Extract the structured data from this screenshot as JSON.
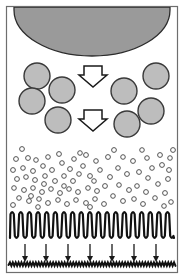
{
  "figure": {
    "width": 185,
    "height": 280,
    "background": "#ffffff",
    "frame": {
      "x": 6.5,
      "y": 6.5,
      "width": 171,
      "height": 266,
      "stroke": "#6e6e6e",
      "stroke_width": 1.2,
      "fill": "#ffffff"
    },
    "colors": {
      "particle_fill": "#bdbdbd",
      "particle_stroke": "#3a3a3a",
      "dome_fill": "#9a9a9a",
      "dome_stroke": "#2b2b2b",
      "bubble_fill": "#ffffff",
      "bubble_stroke": "#4a4a4a",
      "arrow_fill": "#ffffff",
      "arrow_stroke": "#1a1a1a",
      "wave_stroke": "#111111",
      "small_arrow_stroke": "#1a1a1a",
      "substrate_stroke": "#111111",
      "frame_stroke": "#6e6e6e"
    },
    "layers": [
      {
        "name": "source-dome",
        "label": "source-dome",
        "shape": "half-ellipse",
        "cx": 92,
        "top": 8,
        "rx": 78,
        "ry": 45
      },
      {
        "name": "particle-field",
        "label": "particle-field",
        "shape": "large-circles",
        "radius": 13,
        "count": 8,
        "positions": [
          {
            "cx": 37,
            "cy": 76
          },
          {
            "cx": 62,
            "cy": 90
          },
          {
            "cx": 32,
            "cy": 101
          },
          {
            "cx": 58,
            "cy": 120
          },
          {
            "cx": 124,
            "cy": 91
          },
          {
            "cx": 156,
            "cy": 76
          },
          {
            "cx": 151,
            "cy": 111
          },
          {
            "cx": 127,
            "cy": 124
          }
        ]
      },
      {
        "name": "flow-arrows",
        "label": "flow-arrows",
        "shape": "block-arrow-down",
        "count": 2,
        "positions": [
          {
            "cx": 93,
            "top": 66,
            "width": 26,
            "height": 21
          },
          {
            "cx": 93,
            "top": 110,
            "width": 26,
            "height": 21
          }
        ]
      },
      {
        "name": "bubble-field",
        "label": "bubble-field",
        "shape": "small-open-circles",
        "radius": 2.3,
        "count": 96,
        "region": {
          "x": 9,
          "y": 146,
          "width": 166,
          "height": 64
        }
      },
      {
        "name": "wave-layer",
        "label": "wave-layer",
        "shape": "square-wave",
        "baseline_top": 212,
        "baseline_bottom": 238,
        "cycles": 19,
        "stroke_width": 2.2
      },
      {
        "name": "deposition-arrows",
        "label": "deposition-arrows",
        "shape": "thin-arrow-down",
        "count": 7,
        "top": 244,
        "bottom": 262,
        "xs": [
          25,
          46,
          68,
          90,
          112,
          134,
          156
        ]
      },
      {
        "name": "substrate-layer",
        "label": "substrate-layer",
        "shape": "fine-zigzag",
        "y": 265,
        "amplitude": 2.6,
        "teeth": 58,
        "stroke_width": 2.0
      }
    ]
  }
}
